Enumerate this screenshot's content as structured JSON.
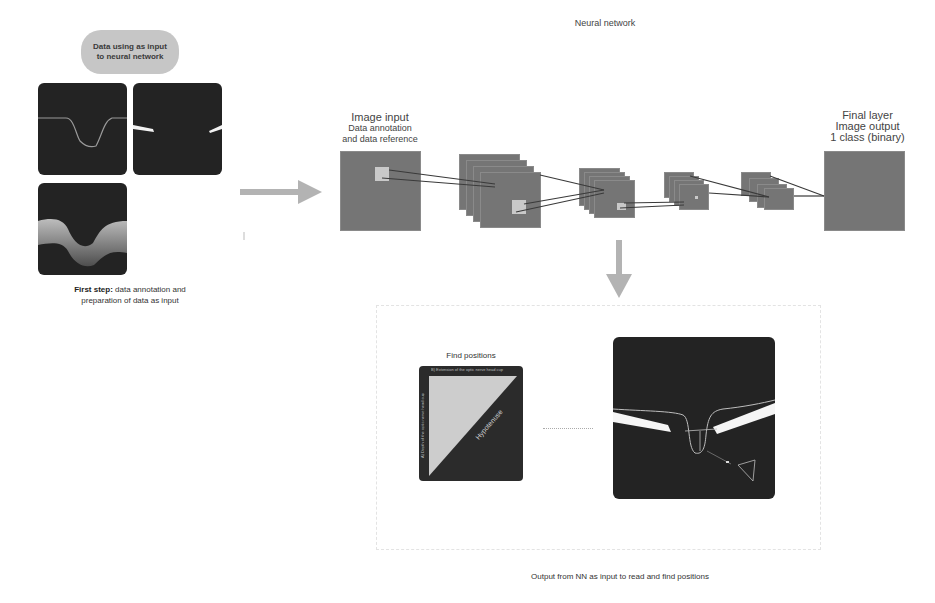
{
  "left_panel": {
    "pill_line1": "Data using as input",
    "pill_line2": "to neural network",
    "caption_bold": "First step:",
    "caption_rest": " data annotation and",
    "caption_line2": "preparation of data as input",
    "images": [
      "annotation-curve",
      "segmentation-mask",
      "oct-scan"
    ]
  },
  "neural_network": {
    "title": "Neural network",
    "input_label": {
      "line1": "Image input",
      "line2": "Data annotation",
      "line3": "and data reference"
    },
    "output_label": {
      "line1": "Final layer",
      "line2": "Image output",
      "line3": "1 class (binary)"
    }
  },
  "output_section": {
    "find_positions_title": "Find positions",
    "triangle_top_label": "B) Extension of the optic nerve head cup",
    "triangle_side_label": "A) Depth of the optic nerve head cup",
    "hypotenuse_label": "Hypotenuse",
    "caption": "Output from NN as input to read and find positions"
  },
  "colors": {
    "arrow": "#b3b3b3",
    "layer_fill": "#757575",
    "patch_fill": "#c9c9c9",
    "oct_bg": "#232323",
    "pill_bg": "#c6c6c6",
    "triangle_light": "#cdcdcd"
  }
}
